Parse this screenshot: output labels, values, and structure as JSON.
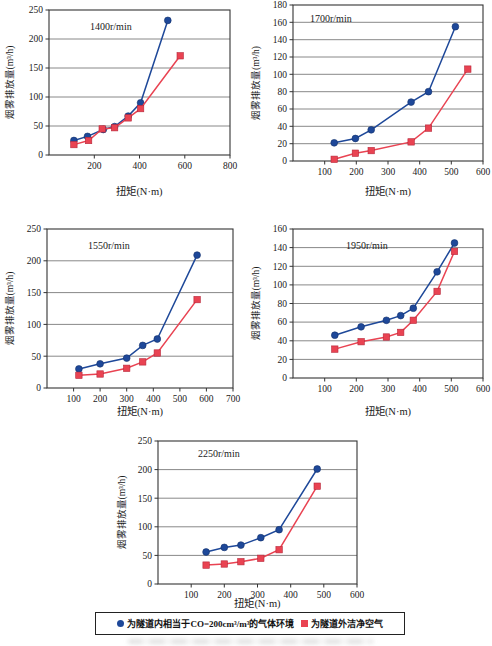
{
  "figure": {
    "type": "multi-panel-smoke-emission-charts",
    "panel_count": 5
  },
  "legend": {
    "items": [
      {
        "marker": "circle",
        "color": "#1e4899",
        "label": "为隧道内相当于CO=200cm³/m³的气体环境"
      },
      {
        "marker": "square",
        "color": "#e94352",
        "label": "为隧道外洁净空气"
      }
    ]
  },
  "chart_data": [
    {
      "type": "line",
      "title": "1400r/min",
      "xlabel": "扭矩(N·m)",
      "ylabel": "烟雾排放量(m³/h)",
      "xlim": [
        0,
        800
      ],
      "xticks": [
        200,
        400,
        600,
        800
      ],
      "ylim": [
        0,
        250
      ],
      "yticks": [
        0,
        50,
        100,
        150,
        200,
        250
      ],
      "grid": "horizontal",
      "series": [
        {
          "name": "为隧道内相当于CO=200cm³/m³的气体环境",
          "marker": "circle",
          "color": "#1e4899",
          "points": [
            [
              110,
              25
            ],
            [
              170,
              32
            ],
            [
              240,
              44
            ],
            [
              290,
              49
            ],
            [
              350,
              67
            ],
            [
              405,
              90
            ],
            [
              525,
              232
            ]
          ]
        },
        {
          "name": "为隧道外洁净空气",
          "marker": "square",
          "color": "#e94352",
          "points": [
            [
              110,
              18
            ],
            [
              175,
              25
            ],
            [
              235,
              45
            ],
            [
              290,
              47
            ],
            [
              350,
              64
            ],
            [
              405,
              80
            ],
            [
              580,
              171
            ]
          ]
        }
      ]
    },
    {
      "type": "line",
      "title": "1700r/min",
      "xlabel": "扭矩(N·m)",
      "ylabel": "烟雾排放量(m³/h)",
      "xlim": [
        0,
        600
      ],
      "xticks": [
        100,
        200,
        300,
        400,
        500,
        600
      ],
      "ylim": [
        0,
        180
      ],
      "yticks": [
        0,
        20,
        40,
        60,
        80,
        100,
        120,
        140,
        160,
        180
      ],
      "grid": "horizontal",
      "series": [
        {
          "name": "为隧道内相当于CO=200cm³/m³的气体环境",
          "marker": "circle",
          "color": "#1e4899",
          "points": [
            [
              130,
              21
            ],
            [
              197,
              26
            ],
            [
              247,
              36
            ],
            [
              373,
              68
            ],
            [
              428,
              80
            ],
            [
              513,
              155
            ]
          ]
        },
        {
          "name": "为隧道外洁净空气",
          "marker": "square",
          "color": "#e94352",
          "points": [
            [
              130,
              2
            ],
            [
              197,
              9
            ],
            [
              247,
              12
            ],
            [
              373,
              22
            ],
            [
              428,
              38
            ],
            [
              552,
              106
            ]
          ]
        }
      ]
    },
    {
      "type": "line",
      "title": "1550r/min",
      "xlabel": "扭矩(N·m)",
      "ylabel": "烟雾排放量(m³/h)",
      "xlim": [
        0,
        700
      ],
      "xticks": [
        100,
        200,
        300,
        400,
        500,
        600,
        700
      ],
      "ylim": [
        0,
        250
      ],
      "yticks": [
        0,
        50,
        100,
        150,
        200,
        250
      ],
      "grid": "horizontal",
      "series": [
        {
          "name": "为隧道内相当于CO=200cm³/m³的气体环境",
          "marker": "circle",
          "color": "#1e4899",
          "points": [
            [
              120,
              30
            ],
            [
              200,
              38
            ],
            [
              300,
              47
            ],
            [
              360,
              67
            ],
            [
              415,
              77
            ],
            [
              565,
              209
            ]
          ]
        },
        {
          "name": "为隧道外洁净空气",
          "marker": "square",
          "color": "#e94352",
          "points": [
            [
              120,
              20
            ],
            [
              200,
              22
            ],
            [
              300,
              31
            ],
            [
              360,
              41
            ],
            [
              415,
              55
            ],
            [
              565,
              139
            ]
          ]
        }
      ]
    },
    {
      "type": "line",
      "title": "1950r/min",
      "xlabel": "扭矩(N·m)",
      "ylabel": "烟雾排放量(m³/h)",
      "xlim": [
        0,
        600
      ],
      "xticks": [
        100,
        200,
        300,
        400,
        500,
        600
      ],
      "ylim": [
        0,
        160
      ],
      "yticks": [
        0,
        20,
        40,
        60,
        80,
        100,
        120,
        140,
        160
      ],
      "grid": "horizontal",
      "series": [
        {
          "name": "为隧道内相当于CO=200cm³/m³的气体环境",
          "marker": "circle",
          "color": "#1e4899",
          "points": [
            [
              132,
              46
            ],
            [
              215,
              55
            ],
            [
              295,
              62
            ],
            [
              340,
              67
            ],
            [
              380,
              75
            ],
            [
              455,
              114
            ],
            [
              510,
              145
            ]
          ]
        },
        {
          "name": "为隧道外洁净空气",
          "marker": "square",
          "color": "#e94352",
          "points": [
            [
              132,
              31
            ],
            [
              215,
              39
            ],
            [
              295,
              44
            ],
            [
              340,
              49
            ],
            [
              380,
              62
            ],
            [
              455,
              93
            ],
            [
              510,
              136
            ]
          ]
        }
      ]
    },
    {
      "type": "line",
      "title": "2250r/min",
      "xlabel": "扭矩(N·m)",
      "ylabel": "烟雾排放量(m³/h)",
      "xlim": [
        0,
        600
      ],
      "xticks": [
        100,
        200,
        300,
        400,
        500,
        600
      ],
      "ylim": [
        0,
        250
      ],
      "yticks": [
        0,
        50,
        100,
        150,
        200,
        250
      ],
      "grid": "horizontal",
      "series": [
        {
          "name": "为隧道内相当于CO=200cm³/m³的气体环境",
          "marker": "circle",
          "color": "#1e4899",
          "points": [
            [
              145,
              56
            ],
            [
              200,
              64
            ],
            [
              250,
              68
            ],
            [
              310,
              81
            ],
            [
              365,
              95
            ],
            [
              480,
              201
            ]
          ]
        },
        {
          "name": "为隧道外洁净空气",
          "marker": "square",
          "color": "#e94352",
          "points": [
            [
              145,
              33
            ],
            [
              200,
              35
            ],
            [
              250,
              39
            ],
            [
              310,
              45
            ],
            [
              365,
              60
            ],
            [
              480,
              171
            ]
          ]
        }
      ]
    }
  ]
}
